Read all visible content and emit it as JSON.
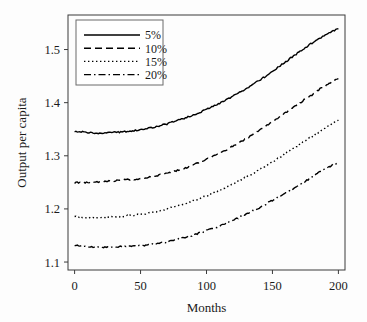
{
  "chart_data": {
    "type": "line",
    "title": "",
    "xlabel": "Months",
    "ylabel": "Output per capita",
    "xlim": [
      -5,
      205
    ],
    "ylim": [
      1.085,
      1.565
    ],
    "xticks": [
      0,
      50,
      100,
      150,
      200
    ],
    "xtick_labels": [
      "0",
      "50",
      "100",
      "150",
      "200"
    ],
    "yticks": [
      1.1,
      1.2,
      1.3,
      1.4,
      1.5
    ],
    "ytick_labels": [
      "1.1",
      "1.2",
      "1.3",
      "1.4",
      "1.5"
    ],
    "grid": false,
    "legend_position": "upper-left-inside",
    "x": [
      0,
      5,
      10,
      15,
      20,
      25,
      30,
      35,
      40,
      45,
      50,
      55,
      60,
      65,
      70,
      75,
      80,
      85,
      90,
      95,
      100,
      105,
      110,
      115,
      120,
      125,
      130,
      135,
      140,
      145,
      150,
      155,
      160,
      165,
      170,
      175,
      180,
      185,
      190,
      195,
      200
    ],
    "series": [
      {
        "name": "5%",
        "linestyle": "solid",
        "color": "#000000",
        "values": [
          1.346,
          1.345,
          1.344,
          1.343,
          1.343,
          1.344,
          1.344,
          1.345,
          1.346,
          1.347,
          1.349,
          1.351,
          1.354,
          1.357,
          1.36,
          1.364,
          1.368,
          1.372,
          1.377,
          1.382,
          1.387,
          1.393,
          1.399,
          1.405,
          1.412,
          1.419,
          1.426,
          1.434,
          1.442,
          1.45,
          1.459,
          1.468,
          1.477,
          1.486,
          1.495,
          1.504,
          1.512,
          1.52,
          1.528,
          1.534,
          1.54
        ]
      },
      {
        "name": "10%",
        "linestyle": "dashed",
        "color": "#000000",
        "values": [
          1.249,
          1.25,
          1.25,
          1.25,
          1.251,
          1.252,
          1.253,
          1.254,
          1.255,
          1.256,
          1.257,
          1.259,
          1.261,
          1.264,
          1.267,
          1.27,
          1.274,
          1.278,
          1.283,
          1.288,
          1.293,
          1.299,
          1.305,
          1.311,
          1.318,
          1.325,
          1.332,
          1.34,
          1.348,
          1.356,
          1.364,
          1.372,
          1.381,
          1.39,
          1.398,
          1.407,
          1.415,
          1.424,
          1.432,
          1.439,
          1.445
        ]
      },
      {
        "name": "15%",
        "linestyle": "dotted",
        "color": "#000000",
        "values": [
          1.185,
          1.184,
          1.183,
          1.183,
          1.183,
          1.184,
          1.185,
          1.186,
          1.187,
          1.188,
          1.19,
          1.192,
          1.194,
          1.197,
          1.2,
          1.203,
          1.207,
          1.211,
          1.215,
          1.22,
          1.225,
          1.23,
          1.235,
          1.241,
          1.247,
          1.253,
          1.26,
          1.267,
          1.274,
          1.281,
          1.288,
          1.296,
          1.304,
          1.312,
          1.32,
          1.328,
          1.336,
          1.344,
          1.352,
          1.36,
          1.368
        ]
      },
      {
        "name": "20%",
        "linestyle": "dashdot",
        "color": "#000000",
        "values": [
          1.131,
          1.13,
          1.129,
          1.128,
          1.128,
          1.128,
          1.129,
          1.129,
          1.13,
          1.13,
          1.131,
          1.132,
          1.134,
          1.136,
          1.138,
          1.141,
          1.144,
          1.147,
          1.151,
          1.155,
          1.159,
          1.163,
          1.168,
          1.173,
          1.178,
          1.184,
          1.19,
          1.196,
          1.202,
          1.209,
          1.216,
          1.223,
          1.23,
          1.237,
          1.245,
          1.252,
          1.26,
          1.268,
          1.275,
          1.282,
          1.288
        ]
      }
    ],
    "legend": [
      {
        "label": "5%",
        "linestyle": "solid"
      },
      {
        "label": "10%",
        "linestyle": "dashed"
      },
      {
        "label": "15%",
        "linestyle": "dotted"
      },
      {
        "label": "20%",
        "linestyle": "dashdot"
      }
    ]
  }
}
